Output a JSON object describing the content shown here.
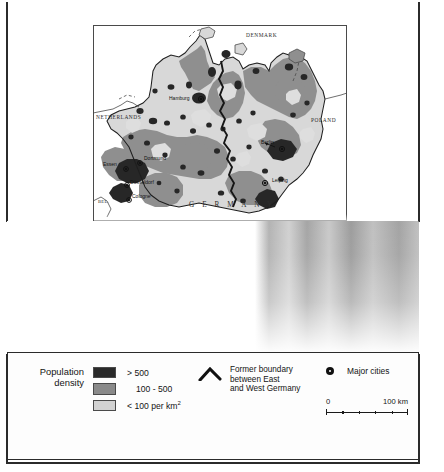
{
  "figure": {
    "kind": "thematic-map",
    "germany_label": "G E R M A N Y"
  },
  "map": {
    "country_labels": [
      {
        "name": "DENMARK",
        "x": 153,
        "y": 9
      },
      {
        "name": "NETHERLANDS",
        "x": 4,
        "y": 91
      },
      {
        "name": "POLAND",
        "x": 219,
        "y": 94
      },
      {
        "name": "BEL.",
        "x": 5,
        "y": 176
      }
    ],
    "germany_label_pos": {
      "x": 96,
      "y": 178
    },
    "cities": [
      {
        "name": "Hamburg",
        "dot_x": 108,
        "dot_y": 74,
        "lx": 78,
        "ly": 72
      },
      {
        "name": "Berlin",
        "dot_x": 189,
        "dot_y": 124,
        "lx": 169,
        "ly": 116
      },
      {
        "name": "Leipzig",
        "dot_x": 172,
        "dot_y": 158,
        "lx": 180,
        "ly": 154
      },
      {
        "name": "Essen",
        "dot_x": 33,
        "dot_y": 144,
        "lx": 11,
        "ly": 138
      },
      {
        "name": "Dortmund",
        "dot_x": 47,
        "dot_y": 138,
        "lx": 52,
        "ly": 132
      },
      {
        "name": "Düsseldorf",
        "dot_x": 34,
        "dot_y": 160,
        "lx": 38,
        "ly": 156
      },
      {
        "name": "Cologne",
        "dot_x": 36,
        "dot_y": 175,
        "lx": 40,
        "ly": 170
      }
    ]
  },
  "legend": {
    "title": "Population\ndensity",
    "title_line1": "Population",
    "title_line2": "density",
    "density_classes": [
      {
        "label": "> 500",
        "color": "#2a2a2a",
        "indent": false
      },
      {
        "label": "100 - 500",
        "color": "#8a8a8a",
        "indent": true
      },
      {
        "label": "< 100 per km",
        "sup": "2",
        "color": "#d2d2d2",
        "indent": false
      }
    ],
    "boundary": {
      "icon": "chevron-up-thick-icon",
      "line1": "Former boundary",
      "line2": "between East",
      "line3": "and West Germany"
    },
    "cities": {
      "icon": "city-dot-icon",
      "label": "Major cities"
    },
    "scale": {
      "min": "0",
      "max": "100 km",
      "units": "km"
    }
  }
}
